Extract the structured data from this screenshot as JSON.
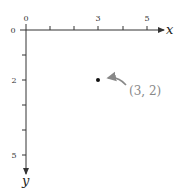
{
  "diagram": {
    "axes": {
      "x_label": "x",
      "y_label": "y",
      "x_tick_labels": [
        {
          "value": 0,
          "label": "0"
        },
        {
          "value": 3,
          "label": "3"
        },
        {
          "value": 5,
          "label": "5"
        }
      ],
      "y_tick_labels": [
        {
          "value": 0,
          "label": "0"
        },
        {
          "value": 2,
          "label": "2"
        },
        {
          "value": 5,
          "label": "5"
        }
      ],
      "x_ticks": [
        0,
        1,
        2,
        3,
        4,
        5
      ],
      "y_ticks": [
        0,
        1,
        2,
        3,
        4,
        5
      ],
      "y_direction": "down"
    },
    "point": {
      "x": 3,
      "y": 2,
      "label": "(3, 2)"
    },
    "colors": {
      "axis": "#333333",
      "point": "#111111",
      "label": "#888888"
    }
  }
}
